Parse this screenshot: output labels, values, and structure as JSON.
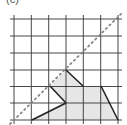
{
  "figure": {
    "label": "(c)",
    "grid": {
      "x_lines": [
        14,
        31.3,
        48.7,
        66,
        83.3,
        100.7,
        118
      ],
      "y_lines": [
        19,
        36,
        53,
        70,
        86.5,
        103,
        120
      ],
      "x_min": 0,
      "x_max": 127,
      "line_color": "#333333"
    },
    "mirror_line": {
      "style": "dotted",
      "color": "#888888",
      "from": [
        10,
        124
      ],
      "to": [
        122,
        13
      ]
    },
    "shaded_shape": {
      "fill": "#e6e6e6",
      "points": [
        [
          32,
          120
        ],
        [
          66,
          103
        ],
        [
          50,
          86
        ],
        [
          66,
          70
        ],
        [
          83,
          86
        ],
        [
          101,
          86
        ],
        [
          118,
          120
        ]
      ]
    },
    "dark_edges": [
      [
        [
          32,
          120
        ],
        [
          66,
          103
        ]
      ],
      [
        [
          66,
          103
        ],
        [
          50,
          86
        ]
      ],
      [
        [
          66,
          70
        ],
        [
          83,
          86
        ]
      ],
      [
        [
          101,
          86
        ],
        [
          118,
          120
        ]
      ]
    ]
  }
}
